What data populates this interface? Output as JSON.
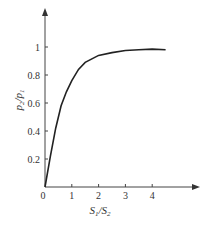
{
  "chart_data": {
    "type": "line",
    "title": "",
    "xlabel": "S1/S2",
    "ylabel": "p2/p1",
    "xlim": [
      0,
      5
    ],
    "ylim": [
      0,
      1.2
    ],
    "grid": false,
    "legend": null,
    "x_ticks": [
      "0",
      "1",
      "2",
      "3",
      "4"
    ],
    "y_ticks": [
      "0.2",
      "0.4",
      "0.6",
      "0.8",
      "1"
    ],
    "series": [
      {
        "name": "p2/p1",
        "x": [
          0,
          0.2,
          0.4,
          0.6,
          0.8,
          1.0,
          1.25,
          1.5,
          2.0,
          2.5,
          3.0,
          3.5,
          4.0,
          4.5
        ],
        "values": [
          0,
          0.22,
          0.42,
          0.58,
          0.68,
          0.76,
          0.84,
          0.89,
          0.94,
          0.96,
          0.975,
          0.98,
          0.985,
          0.98
        ]
      }
    ]
  },
  "labels": {
    "x_axis": {
      "main": "S",
      "sub1": "1",
      "slash": "/S",
      "sub2": "2"
    },
    "y_axis": {
      "main": "p",
      "sub1": "2",
      "slash": "/p",
      "sub2": "1"
    }
  }
}
